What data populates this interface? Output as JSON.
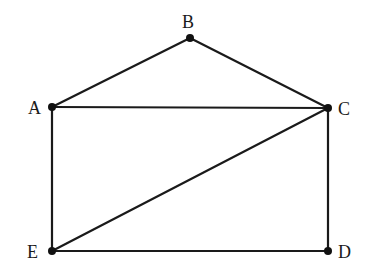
{
  "diagram": {
    "type": "graph",
    "nodes": [
      {
        "id": "A",
        "label": "A",
        "x": 52,
        "y": 107,
        "label_x": 28,
        "label_y": 114
      },
      {
        "id": "B",
        "label": "B",
        "x": 190,
        "y": 38,
        "label_x": 182,
        "label_y": 28
      },
      {
        "id": "C",
        "label": "C",
        "x": 328,
        "y": 108,
        "label_x": 338,
        "label_y": 115
      },
      {
        "id": "D",
        "label": "D",
        "x": 328,
        "y": 251,
        "label_x": 338,
        "label_y": 258
      },
      {
        "id": "E",
        "label": "E",
        "x": 52,
        "y": 251,
        "label_x": 27,
        "label_y": 258
      }
    ],
    "edges": [
      {
        "from": "A",
        "to": "B"
      },
      {
        "from": "B",
        "to": "C"
      },
      {
        "from": "A",
        "to": "C"
      },
      {
        "from": "A",
        "to": "E"
      },
      {
        "from": "C",
        "to": "D"
      },
      {
        "from": "E",
        "to": "D"
      },
      {
        "from": "E",
        "to": "C"
      }
    ],
    "colors": {
      "line": "#1a1a1a",
      "node": "#111111",
      "background": "#ffffff"
    }
  }
}
